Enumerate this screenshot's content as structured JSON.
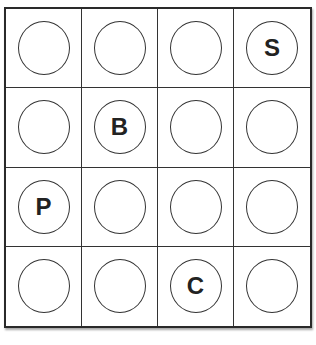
{
  "board": {
    "rows": 4,
    "cols": 4,
    "cells": [
      [
        "",
        "",
        "",
        "S"
      ],
      [
        "",
        "B",
        "",
        ""
      ],
      [
        "P",
        "",
        "",
        ""
      ],
      [
        "",
        "",
        "C",
        ""
      ]
    ]
  }
}
